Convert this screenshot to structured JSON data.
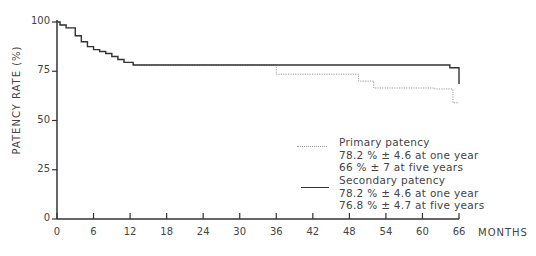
{
  "chart_data": {
    "type": "line",
    "subtype": "kaplan-meier step",
    "title": "",
    "xlabel": "MONTHS",
    "ylabel": "PATENCY RATE (%)",
    "xlim": [
      0,
      66
    ],
    "ylim": [
      0,
      100
    ],
    "xticks": [
      0,
      6,
      12,
      18,
      24,
      30,
      36,
      42,
      48,
      54,
      60,
      66
    ],
    "yticks": [
      0,
      25,
      50,
      75,
      100
    ],
    "grid": false,
    "legend_position": "right-middle",
    "series": [
      {
        "name": "Primary patency",
        "style": "dotted",
        "color": "#999999",
        "x": [
          0,
          0.5,
          1.5,
          3,
          4,
          5,
          6,
          7,
          8,
          9,
          10,
          11,
          12.5,
          36,
          48,
          49.5,
          52,
          62,
          65,
          66
        ],
        "y": [
          100,
          98.5,
          97,
          93,
          90,
          87.5,
          86,
          85,
          84,
          82.5,
          81,
          79.5,
          78.2,
          73.5,
          73.5,
          70,
          66.5,
          66,
          59,
          59
        ]
      },
      {
        "name": "Secondary patency",
        "style": "solid",
        "color": "#333333",
        "x": [
          0,
          0.5,
          1.5,
          3,
          4,
          5,
          6,
          7,
          8,
          9,
          10,
          11,
          12.5,
          64.5,
          66
        ],
        "y": [
          100,
          98.5,
          97,
          93,
          90,
          87.5,
          86,
          85,
          84,
          82.5,
          81,
          79.5,
          78.2,
          76.8,
          68.5
        ]
      }
    ],
    "annotations": [
      "Primary patency",
      "78.2 % ± 4.6 at one year",
      "66 % ± 7 at five years",
      "Secondary patency",
      "78.2 % ± 4.6 at one year",
      "76.8 % ± 4.7 at five years"
    ]
  },
  "legend": {
    "primary": {
      "title": "Primary patency",
      "line1": "78.2 % ± 4.6 at one year",
      "line2": "66 % ± 7 at five years"
    },
    "secondary": {
      "title": "Secondary patency",
      "line1": "78.2 % ± 4.6 at one year",
      "line2": "76.8 % ± 4.7 at five years"
    }
  },
  "axes": {
    "xlabel": "MONTHS",
    "ylabel": "PATENCY RATE (%)",
    "xticks": [
      "0",
      "6",
      "12",
      "18",
      "24",
      "30",
      "36",
      "42",
      "48",
      "54",
      "60",
      "66"
    ],
    "yticks": [
      "100",
      "75",
      "50",
      "25",
      "0"
    ]
  }
}
